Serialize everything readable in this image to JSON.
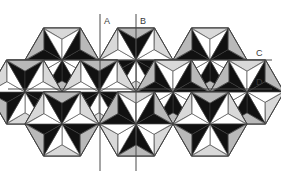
{
  "figure": {
    "title": "",
    "background": "#ffffff",
    "width": 281,
    "height": 171
  },
  "pattern": {
    "name": "hexagonal six-pointed star rosette tessellation",
    "description": "Tiling of hexagons each containing a six-pointed star made of alternating black and white triangles with light grey bevelled facets",
    "colors": {
      "black": "#111111",
      "white": "#ffffff",
      "light_grey": "#d9d9d9",
      "mid_grey": "#b9b9b9",
      "outline": "#3c3c3c"
    },
    "hex_radius": 37,
    "centers": [
      {
        "cx": 62,
        "cy": 60
      },
      {
        "cx": 136,
        "cy": 60
      },
      {
        "cx": 210,
        "cy": 60
      },
      {
        "cx": 99,
        "cy": 92
      },
      {
        "cx": 173,
        "cy": 92
      },
      {
        "cx": 25,
        "cy": 92
      },
      {
        "cx": 247,
        "cy": 92
      },
      {
        "cx": 62,
        "cy": 124
      },
      {
        "cx": 136,
        "cy": 124
      },
      {
        "cx": 210,
        "cy": 124
      }
    ]
  },
  "reference_lines": [
    {
      "id": "A",
      "orientation": "vertical",
      "position": 100,
      "label": "A",
      "label_x": 104,
      "label_y": 24,
      "x1": 100,
      "y1": 14,
      "x2": 100,
      "y2": 171
    },
    {
      "id": "B",
      "orientation": "vertical",
      "position": 136,
      "label": "B",
      "label_x": 140,
      "label_y": 24,
      "x1": 136,
      "y1": 14,
      "x2": 136,
      "y2": 171
    },
    {
      "id": "C",
      "orientation": "horizontal",
      "position": 60,
      "label": "C",
      "label_x": 256,
      "label_y": 56,
      "x1": 8,
      "y1": 60,
      "x2": 272,
      "y2": 60
    },
    {
      "id": "D",
      "orientation": "horizontal",
      "position": 89,
      "label": "D",
      "label_x": 256,
      "label_y": 85,
      "x1": 8,
      "y1": 89,
      "x2": 272,
      "y2": 89
    }
  ],
  "line_style": {
    "stroke": "#4a4a4a",
    "stroke_width": 1
  }
}
